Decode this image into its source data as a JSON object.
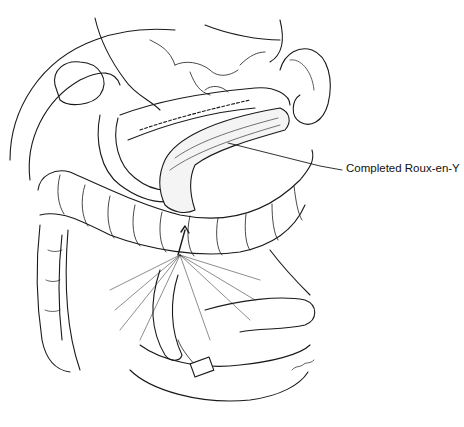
{
  "figure": {
    "colors": {
      "line": "#1a1a1a",
      "background": "#ffffff"
    },
    "annotations": [
      {
        "label": "Completed Roux-en-Y",
        "leader_from": [
          228,
          143
        ],
        "leader_to": [
          342,
          170
        ]
      }
    ]
  }
}
